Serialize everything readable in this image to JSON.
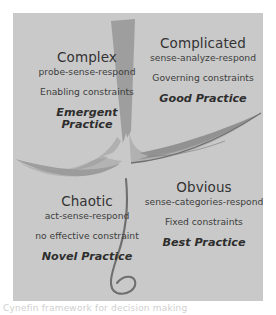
{
  "figure": {
    "name": "cynefin-framework-diagram",
    "panel_color": "#c9c9c9",
    "stroke_color": "#8c8c8c",
    "text_color": "#3b3b3b",
    "caption_partial": "Cynefin framework for decision making"
  },
  "quadrants": {
    "complex": {
      "title": "Complex",
      "approach": "probe-sense-respond",
      "constraint": "Enabling constraints",
      "practice_line1": "Emergent",
      "practice_line2": "Practice"
    },
    "complicated": {
      "title": "Complicated",
      "approach": "sense-analyze-respond",
      "constraint": "Governing constraints",
      "practice": "Good Practice"
    },
    "chaotic": {
      "title": "Chaotic",
      "approach": "act-sense-respond",
      "constraint": "no effective constraint",
      "practice": "Novel Practice"
    },
    "obvious": {
      "title": "Obvious",
      "approach": "sense-categories-respond",
      "constraint": "Fixed constraints",
      "practice": "Best Practice"
    }
  }
}
